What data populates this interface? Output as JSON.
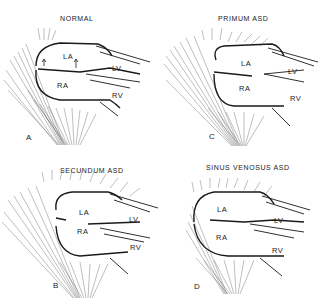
{
  "figure": {
    "panels": [
      {
        "id": "A",
        "title": "NORMAL",
        "letter": "A",
        "labels": {
          "la": "LA",
          "ra": "RA",
          "lv": "LV",
          "rv": "RV"
        }
      },
      {
        "id": "C",
        "title": "PRIMUM ASD",
        "letter": "C",
        "labels": {
          "la": "LA",
          "ra": "RA",
          "lv": "LV",
          "rv": "RV"
        }
      },
      {
        "id": "B",
        "title": "SECUNDUM ASD",
        "letter": "B",
        "labels": {
          "la": "LA",
          "ra": "RA",
          "lv": "LV",
          "rv": "RV"
        }
      },
      {
        "id": "D",
        "title": "SINUS VENOSUS ASD",
        "letter": "D",
        "labels": {
          "la": "LA",
          "ra": "RA",
          "lv": "LV",
          "rv": "RV"
        }
      }
    ],
    "colors": {
      "ink": "#1a1a1a",
      "background": "#ffffff"
    }
  }
}
